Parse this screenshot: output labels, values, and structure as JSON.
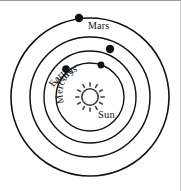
{
  "diagram": {
    "center_body": {
      "name": "Sun",
      "label": "Sun",
      "icon": "sun-starburst-icon",
      "color": "#3a3a3a",
      "cx": 90,
      "cy": 96,
      "radius": 9,
      "ray_count": 12,
      "label_x": 99,
      "label_y": 116
    },
    "stroke_color": "#111111",
    "background_color": "#ffffff",
    "orbits": [
      {
        "planet": "Mercury",
        "label": "Mercury",
        "orbit_index": 1,
        "radius": 34,
        "stroke_width": 1.4,
        "label_curved": true,
        "label_path_radius": 25,
        "label_start_angle_deg": 205,
        "dot": {
          "x": 101,
          "y": 64,
          "r": 3.4,
          "angle_deg": -72
        }
      },
      {
        "planet": "Venus",
        "label": "Venus",
        "orbit_index": 2,
        "radius": 46,
        "stroke_width": 1.4,
        "label_curved": true,
        "label_path_radius": 40,
        "label_start_angle_deg": 212,
        "dot": {
          "x": 66,
          "y": 68,
          "r": 3.8,
          "angle_deg": 220
        }
      },
      {
        "planet": "Earth",
        "label": "Earth",
        "orbit_index": 3,
        "radius": 60,
        "stroke_width": 1.5,
        "label_curved": true,
        "label_path_radius": 52,
        "label_start_angle_deg": 242,
        "dot": {
          "x": 110,
          "y": 48,
          "r": 4.2,
          "angle_deg": -65
        }
      },
      {
        "planet": "Mars",
        "label": "Mars",
        "orbit_index": 4,
        "radius": 79,
        "stroke_width": 1.6,
        "label_curved": false,
        "label_x": 88,
        "label_y": 27,
        "dot": {
          "x": 79,
          "y": 17,
          "r": 4.2,
          "angle_deg": -97
        }
      }
    ]
  }
}
